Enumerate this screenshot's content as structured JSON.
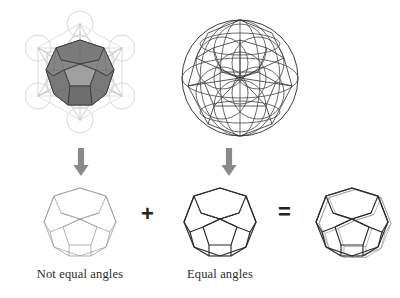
{
  "figure": {
    "background_color": "#ffffff",
    "width": 400,
    "height": 298
  },
  "palette": {
    "metatron_line": "#c9c9c9",
    "metatron_circle": "#cfcfcf",
    "solid_shade_dark": "#6e6e6e",
    "solid_shade_mid": "#8a8a8a",
    "solid_shade_light": "#a5a5a5",
    "solid_outline": "#3a3a3a",
    "sphere_line": "#3b3b3b",
    "faint_poly_line": "#9a9a9a",
    "bold_poly_line": "#2c2c2c",
    "arrow_fill": "#8a8a8a",
    "text_color": "#2b2b2b"
  },
  "top_row": {
    "left_figure": {
      "name": "metatrons-cube-with-dodecahedron",
      "description": "Metatron's Cube: thirteen circles in hexagonal arrangement with connecting lines, shaded dodecahedron at center"
    },
    "right_figure": {
      "name": "sphere-with-inscribed-circles",
      "description": "Sphere with spherical dodecahedron projection and inscribed great circles"
    }
  },
  "arrows": {
    "left": {
      "name": "down-arrow-left",
      "direction": "down"
    },
    "right": {
      "name": "down-arrow-right",
      "direction": "down"
    }
  },
  "bottom_row": {
    "items": [
      {
        "shape": "dodecahedron",
        "style": "faint",
        "label": "Not equal angles"
      },
      {
        "shape": "dodecahedron",
        "style": "bold",
        "label": "Equal angles"
      },
      {
        "shape": "dodecahedron",
        "style": "double-line",
        "label": ""
      }
    ],
    "operators": {
      "plus": "+",
      "equals": "="
    }
  }
}
